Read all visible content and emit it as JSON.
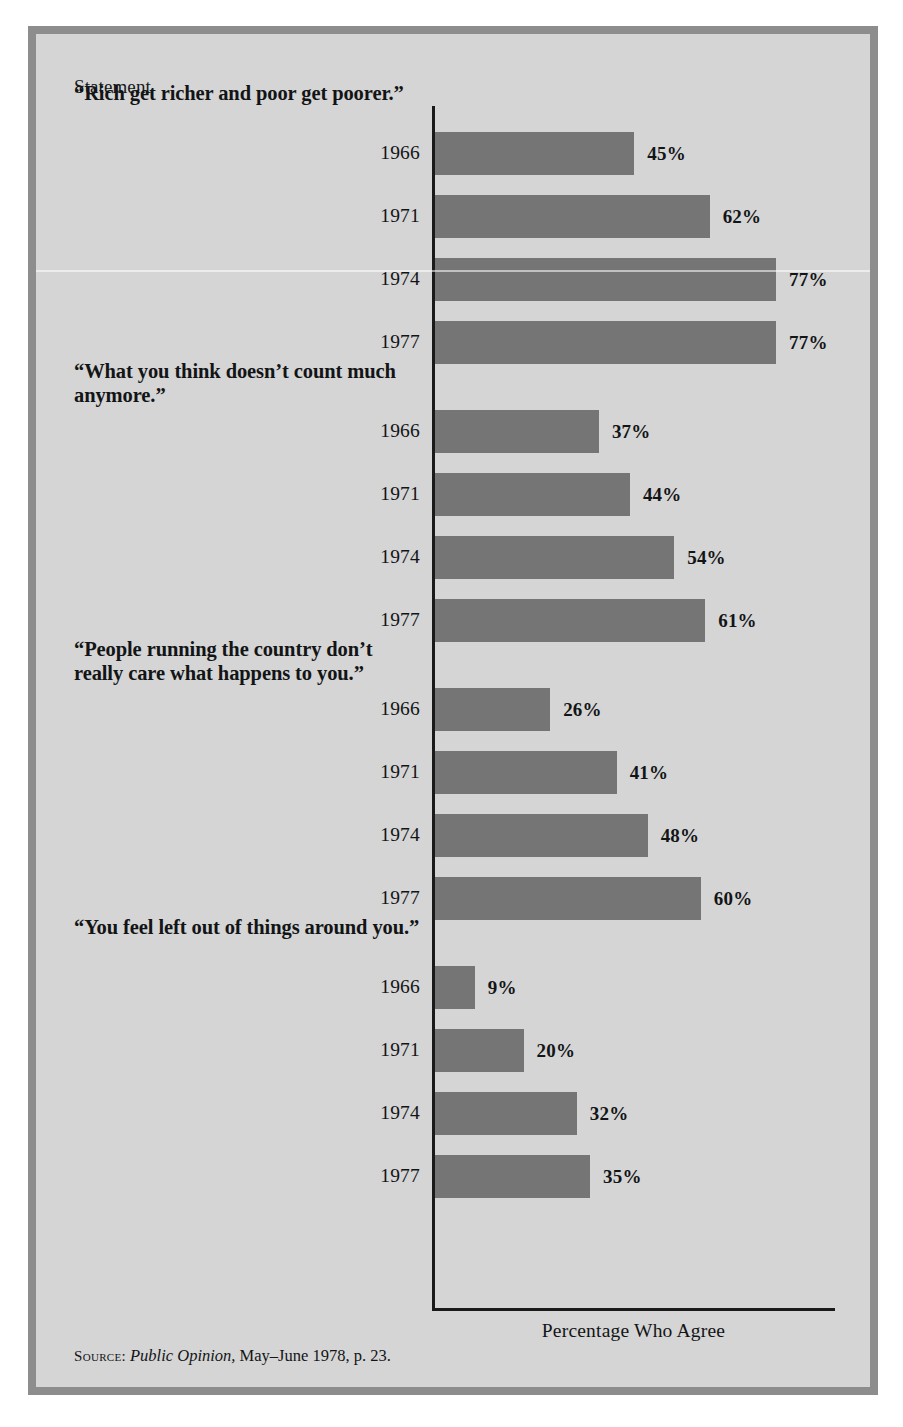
{
  "figure": {
    "column_header": "Statement",
    "axis_caption": "Percentage Who Agree",
    "source_prefix": "Source:",
    "source_italic": "Public Opinion,",
    "source_rest": "May–June 1978, p. 23.",
    "colors": {
      "background": "#d5d5d5",
      "frame": "#8d8d8d",
      "bar": "#757576",
      "text": "#131416",
      "axis": "#1a1a1a"
    }
  },
  "chart_data": {
    "type": "bar",
    "title": "",
    "xlabel": "Percentage Who Agree",
    "ylabel": "Statement",
    "orientation": "horizontal",
    "unit": "%",
    "xlim": [
      0,
      80
    ],
    "grid": false,
    "legend": false,
    "categories": [
      "1966",
      "1971",
      "1974",
      "1977"
    ],
    "groups": [
      {
        "statement": "“Rich get richer and poor get poorer.”",
        "bars": [
          {
            "year": "1966",
            "value": 45,
            "label": "45%"
          },
          {
            "year": "1971",
            "value": 62,
            "label": "62%"
          },
          {
            "year": "1974",
            "value": 77,
            "label": "77%"
          },
          {
            "year": "1977",
            "value": 77,
            "label": "77%"
          }
        ]
      },
      {
        "statement": "“What you think doesn’t count much anymore.”",
        "bars": [
          {
            "year": "1966",
            "value": 37,
            "label": "37%"
          },
          {
            "year": "1971",
            "value": 44,
            "label": "44%"
          },
          {
            "year": "1974",
            "value": 54,
            "label": "54%"
          },
          {
            "year": "1977",
            "value": 61,
            "label": "61%"
          }
        ]
      },
      {
        "statement": "“People running the country don’t really care what happens to you.”",
        "bars": [
          {
            "year": "1966",
            "value": 26,
            "label": "26%"
          },
          {
            "year": "1971",
            "value": 41,
            "label": "41%"
          },
          {
            "year": "1974",
            "value": 48,
            "label": "48%"
          },
          {
            "year": "1977",
            "value": 60,
            "label": "60%"
          }
        ]
      },
      {
        "statement": "“You feel left out of things around you.”",
        "bars": [
          {
            "year": "1966",
            "value": 9,
            "label": "9%"
          },
          {
            "year": "1971",
            "value": 20,
            "label": "20%"
          },
          {
            "year": "1974",
            "value": 32,
            "label": "32%"
          },
          {
            "year": "1977",
            "value": 35,
            "label": "35%"
          }
        ]
      }
    ]
  }
}
